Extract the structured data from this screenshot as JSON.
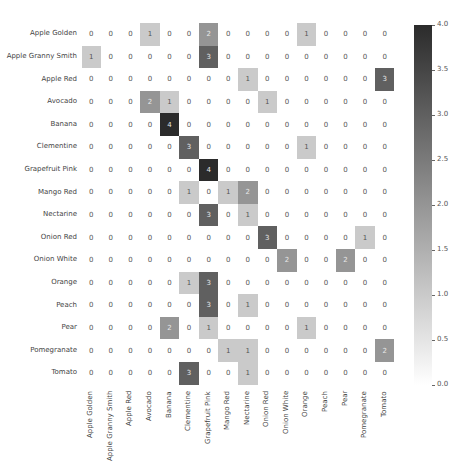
{
  "chart_data": {
    "type": "heatmap",
    "title": "",
    "xlabel": "",
    "ylabel": "",
    "row_labels": [
      "Apple Golden",
      "Apple Granny Smith",
      "Apple Red",
      "Avocado",
      "Banana",
      "Clementine",
      "Grapefruit Pink",
      "Mango Red",
      "Nectarine",
      "Onion Red",
      "Onion White",
      "Orange",
      "Peach",
      "Pear",
      "Pomegranate",
      "Tomato"
    ],
    "col_labels": [
      "Apple Golden",
      "Apple Granny Smith",
      "Apple Red",
      "Avocado",
      "Banana",
      "Clementine",
      "Grapefruit Pink",
      "Mango Red",
      "Nectarine",
      "Onion Red",
      "Onion White",
      "Orange",
      "Peach",
      "Pear",
      "Pomegranate",
      "Tomato"
    ],
    "values": [
      [
        0,
        0,
        0,
        1,
        0,
        0,
        2,
        0,
        0,
        0,
        0,
        1,
        0,
        0,
        0,
        0
      ],
      [
        1,
        0,
        0,
        0,
        0,
        0,
        3,
        0,
        0,
        0,
        0,
        0,
        0,
        0,
        0,
        0
      ],
      [
        0,
        0,
        0,
        0,
        0,
        0,
        0,
        0,
        1,
        0,
        0,
        0,
        0,
        0,
        0,
        3
      ],
      [
        0,
        0,
        0,
        2,
        1,
        0,
        0,
        0,
        0,
        1,
        0,
        0,
        0,
        0,
        0,
        0
      ],
      [
        0,
        0,
        0,
        0,
        4,
        0,
        0,
        0,
        0,
        0,
        0,
        0,
        0,
        0,
        0,
        0
      ],
      [
        0,
        0,
        0,
        0,
        0,
        3,
        0,
        0,
        0,
        0,
        0,
        1,
        0,
        0,
        0,
        0
      ],
      [
        0,
        0,
        0,
        0,
        0,
        0,
        4,
        0,
        0,
        0,
        0,
        0,
        0,
        0,
        0,
        0
      ],
      [
        0,
        0,
        0,
        0,
        0,
        1,
        0,
        1,
        2,
        0,
        0,
        0,
        0,
        0,
        0,
        0
      ],
      [
        0,
        0,
        0,
        0,
        0,
        0,
        3,
        0,
        1,
        0,
        0,
        0,
        0,
        0,
        0,
        0
      ],
      [
        0,
        0,
        0,
        0,
        0,
        0,
        0,
        0,
        0,
        3,
        0,
        0,
        0,
        0,
        1,
        0
      ],
      [
        0,
        0,
        0,
        0,
        0,
        0,
        0,
        0,
        0,
        0,
        2,
        0,
        0,
        2,
        0,
        0
      ],
      [
        0,
        0,
        0,
        0,
        0,
        1,
        3,
        0,
        0,
        0,
        0,
        0,
        0,
        0,
        0,
        0
      ],
      [
        0,
        0,
        0,
        0,
        0,
        0,
        3,
        0,
        1,
        0,
        0,
        0,
        0,
        0,
        0,
        0
      ],
      [
        0,
        0,
        0,
        0,
        2,
        0,
        1,
        0,
        0,
        0,
        0,
        1,
        0,
        0,
        0,
        0
      ],
      [
        0,
        0,
        0,
        0,
        0,
        0,
        0,
        1,
        1,
        0,
        0,
        0,
        0,
        0,
        0,
        2
      ],
      [
        0,
        0,
        0,
        0,
        0,
        3,
        0,
        0,
        1,
        0,
        0,
        0,
        0,
        0,
        0,
        0
      ]
    ],
    "colorbar": {
      "min": 0.0,
      "max": 4.0,
      "ticks": [
        "0.0",
        "0.5",
        "1.0",
        "1.5",
        "2.0",
        "2.5",
        "3.0",
        "3.5",
        "4.0"
      ],
      "color_low": "#ffffff",
      "color_high": "#2b2b2b"
    },
    "annotations": true,
    "grid": false,
    "legend_position": "right (colorbar)"
  }
}
